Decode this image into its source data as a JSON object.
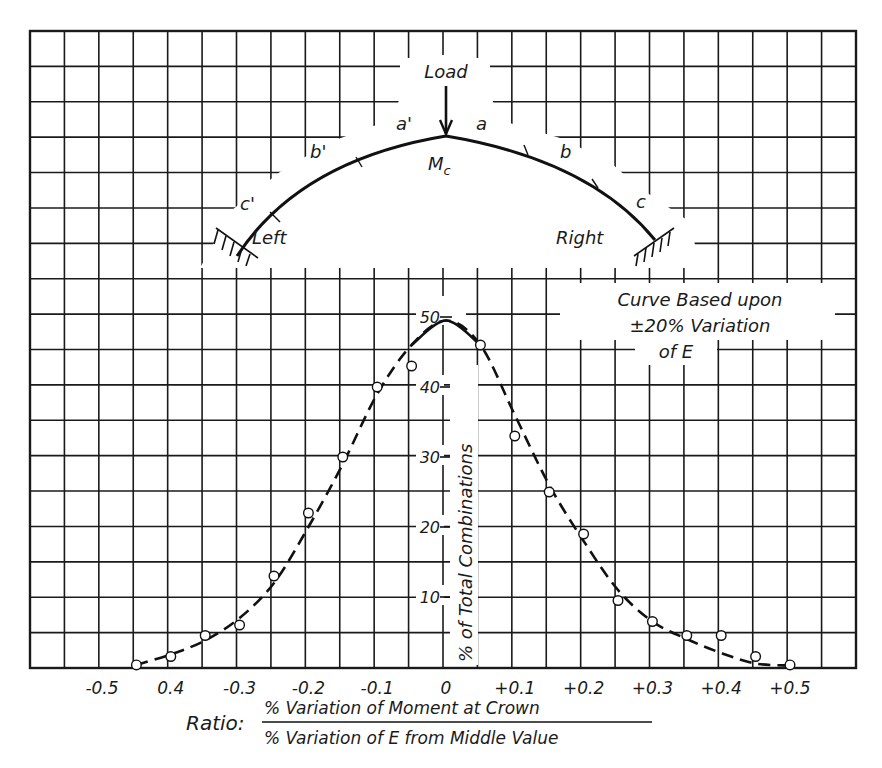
{
  "figure": {
    "load_label": "Load",
    "crown_label": "M",
    "crown_subscript": "c",
    "segment_labels": {
      "a_prime": "a'",
      "a": "a",
      "b_prime": "b'",
      "b": "b",
      "c_prime": "c'",
      "c": "c"
    },
    "support_left": "Left",
    "support_right": "Right",
    "note_line1": "Curve Based upon",
    "note_line2": "±20% Variation",
    "note_line3": "of E",
    "ylabel": "% of Total Combinations",
    "xlabel_prefix": "Ratio:",
    "xlabel_numerator": "% Variation of Moment at Crown",
    "xlabel_denominator": "% Variation of E from Middle Value"
  },
  "chart_data": {
    "type": "scatter",
    "title": "",
    "xlabel": "Ratio: % Variation of Moment at Crown / % Variation of E from Middle Value",
    "ylabel": "% of Total Combinations",
    "x_tick_labels": [
      "-0.5",
      "0.4",
      "-0.3",
      "-0.2",
      "-0.1",
      "0",
      "+0.1",
      "+0.2",
      "+0.3",
      "+0.4",
      "+0.5"
    ],
    "x_ticks": [
      -0.5,
      -0.4,
      -0.3,
      -0.2,
      -0.1,
      0,
      0.1,
      0.2,
      0.3,
      0.4,
      0.5
    ],
    "y_tick_labels": [
      "10",
      "20",
      "30",
      "40",
      "50"
    ],
    "y_ticks": [
      10,
      20,
      30,
      40,
      50
    ],
    "xlim": [
      -0.6,
      0.6
    ],
    "ylim": [
      0,
      50
    ],
    "grid": true,
    "annotation": "Curve Based upon ±20% Variation of E",
    "series": [
      {
        "name": "Observed combinations",
        "marker": "open-circle",
        "x": [
          -0.45,
          -0.4,
          -0.35,
          -0.3,
          -0.25,
          -0.2,
          -0.15,
          -0.1,
          -0.05,
          0.05,
          0.1,
          0.15,
          0.2,
          0.25,
          0.3,
          0.35,
          0.4,
          0.45,
          0.5
        ],
        "y": [
          0.3,
          1.5,
          4.5,
          6,
          13,
          22,
          30,
          40,
          43,
          46,
          33,
          25,
          19,
          9.5,
          6.5,
          4.5,
          4.5,
          1.5,
          0.3
        ]
      },
      {
        "name": "Fitted distribution curve (dashed)",
        "marker": "none",
        "x": [
          -0.45,
          -0.4,
          -0.35,
          -0.3,
          -0.25,
          -0.2,
          -0.15,
          -0.1,
          -0.05,
          0,
          0.05,
          0.1,
          0.15,
          0.2,
          0.25,
          0.3,
          0.35,
          0.4,
          0.45,
          0.5
        ],
        "y": [
          0.3,
          1.8,
          3.8,
          7,
          12,
          20,
          29,
          39,
          46,
          49.5,
          46,
          36,
          26,
          18,
          11,
          6.5,
          4,
          2,
          0.5,
          0.2
        ]
      }
    ]
  }
}
